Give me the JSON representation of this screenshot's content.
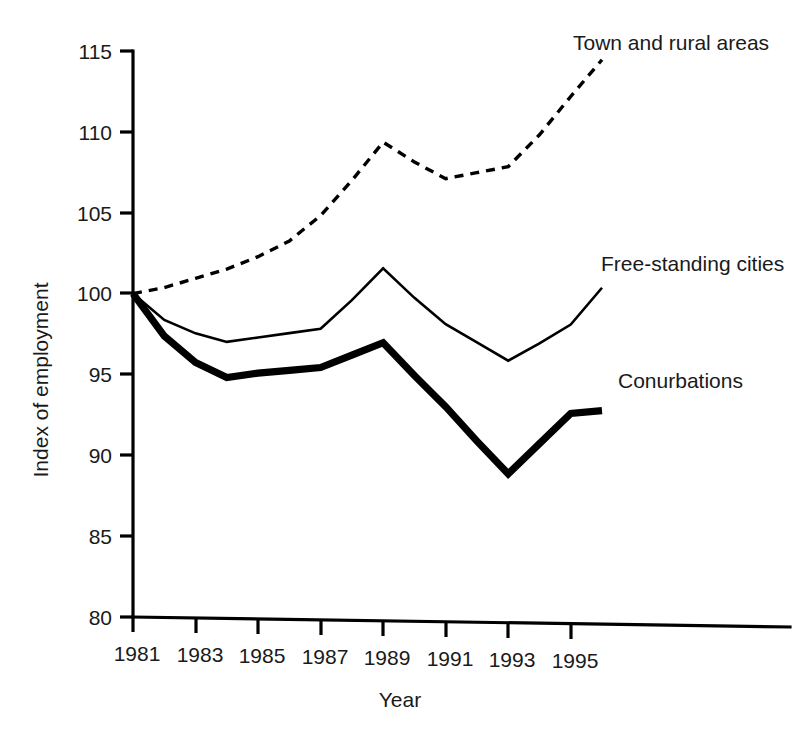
{
  "chart_data": {
    "type": "line",
    "title": "",
    "xlabel": "Year",
    "ylabel": "Index of employment",
    "xlim": [
      1981,
      1996
    ],
    "ylim": [
      80,
      115
    ],
    "yticks": [
      80,
      85,
      90,
      95,
      100,
      105,
      110,
      115
    ],
    "xticks": [
      1981,
      1983,
      1985,
      1987,
      1989,
      1991,
      1993,
      1995
    ],
    "ytick_labels": [
      "80",
      "85",
      "90",
      "95",
      "100",
      "105",
      "110",
      "115"
    ],
    "xtick_labels": [
      "1981",
      "1983",
      "1985",
      "1987",
      "1989",
      "1991",
      "1993",
      "1995"
    ],
    "grid": false,
    "legend_position": "inline-annotations",
    "x": [
      1981,
      1982,
      1983,
      1984,
      1985,
      1986,
      1987,
      1988,
      1989,
      1990,
      1991,
      1992,
      1993,
      1994,
      1995,
      1996
    ],
    "series": [
      {
        "name": "Town and rural areas",
        "style": "dashed",
        "values": [
          100.0,
          100.4,
          101.0,
          101.6,
          102.4,
          103.4,
          105.0,
          107.2,
          109.6,
          108.4,
          107.4,
          107.8,
          108.2,
          110.2,
          112.6,
          114.9
        ]
      },
      {
        "name": "Free-standing cities",
        "style": "solid-thin",
        "values": [
          100.0,
          98.4,
          97.6,
          97.1,
          97.4,
          97.7,
          98.0,
          99.8,
          101.8,
          100.0,
          98.4,
          97.3,
          96.2,
          97.3,
          98.5,
          100.8
        ]
      },
      {
        "name": "Conurbations",
        "style": "solid-thick",
        "values": [
          100.0,
          97.4,
          95.8,
          94.9,
          95.2,
          95.4,
          95.6,
          96.4,
          97.2,
          95.2,
          93.3,
          91.2,
          89.2,
          91.1,
          93.0,
          93.2
        ]
      }
    ],
    "annotations": [
      {
        "text": "Town and rural areas",
        "x": 1991.0,
        "y": 115.3
      },
      {
        "text": "Free-standing cities",
        "x": 1992.0,
        "y": 101.8
      },
      {
        "text": "Conurbations",
        "x": 1993.0,
        "y": 95.6
      }
    ]
  },
  "axes": {
    "y_title": "Index of employment",
    "x_title": "Year",
    "y_tick_labels": [
      "115",
      "110",
      "105",
      "100",
      "95",
      "90",
      "85",
      "80"
    ],
    "x_tick_labels": [
      "1981",
      "1983",
      "1985",
      "1987",
      "1989",
      "1991",
      "1993",
      "1995"
    ]
  },
  "annotations": {
    "town_and_rural": "Town and rural areas",
    "free_standing": "Free-standing cities",
    "conurbations": "Conurbations"
  },
  "colors": {
    "ink": "#000000",
    "text": "#1a1a1a",
    "background": "#ffffff"
  }
}
